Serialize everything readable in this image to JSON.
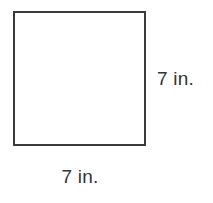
{
  "figure": {
    "shape_name": "square",
    "fill_color": "#ffffff",
    "stroke_color": "#3a3a3a",
    "text_color": "#333333"
  },
  "labels": {
    "right_side": "7 in.",
    "bottom_side": "7 in."
  }
}
